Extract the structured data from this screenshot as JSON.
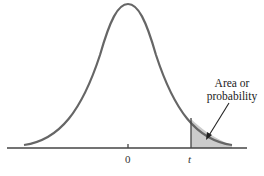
{
  "diagram": {
    "type": "t-distribution density with shaded right tail",
    "annotation": {
      "line1": "Area or",
      "line2": "probability"
    },
    "axis_labels": {
      "center": "0",
      "critical": "t"
    },
    "colors": {
      "curve": "#666666",
      "shade": "#cccccc",
      "axis": "#444444",
      "arrow": "#222222"
    }
  }
}
